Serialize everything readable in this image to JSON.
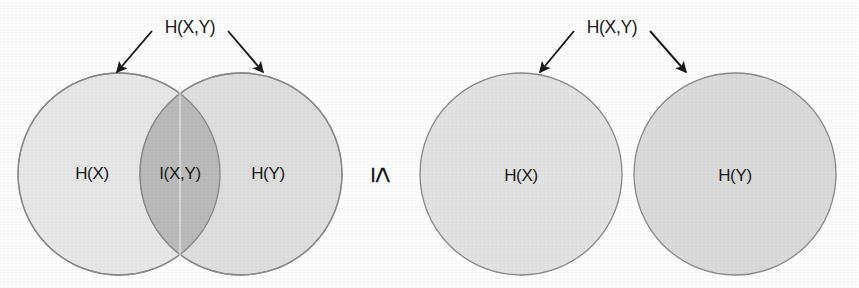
{
  "figure": {
    "relation_symbol": "≤",
    "background_color": "#ffffff"
  },
  "left_diagram": {
    "name": "overlapping-venn",
    "top_label": "H(X,Y)",
    "labels": {
      "left_circle": "H(X)",
      "intersection": "I(X,Y)",
      "right_circle": "H(Y)"
    },
    "colors": {
      "left_fill": "#e9e9e9",
      "right_fill": "#dddddd",
      "intersection_fill": "#bcbcbc",
      "stroke": "#8a8a8a",
      "arrow": "#1a1a1a",
      "text": "#1a1a1a"
    },
    "geometry": {
      "left_circle_center_x": 119,
      "right_circle_center_x": 241,
      "center_y": 174,
      "radius": 101
    }
  },
  "right_diagram": {
    "name": "disjoint-venn",
    "top_label": "H(X,Y)",
    "labels": {
      "left_circle": "H(X)",
      "right_circle": "H(Y)"
    },
    "colors": {
      "left_fill": "#e4e4e4",
      "right_fill": "#dcdcdc",
      "stroke": "#8a8a8a",
      "arrow": "#1a1a1a",
      "text": "#1a1a1a"
    },
    "geometry": {
      "left_circle_center_x": 521,
      "right_circle_center_x": 735,
      "center_y": 174,
      "radius": 101
    }
  },
  "icons": {
    "arrow": "arrow-icon",
    "less-than-or-equal": "less-than-or-equal-icon"
  }
}
